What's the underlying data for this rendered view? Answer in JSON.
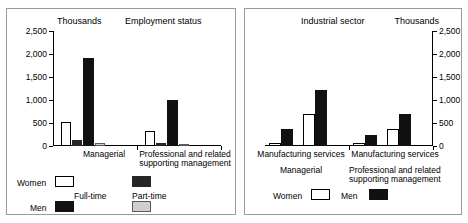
{
  "chart_data": [
    {
      "type": "bar",
      "title": "Employment status",
      "unit_label": "Thousands",
      "xlabel": "",
      "ylabel": "Thousands",
      "ylim": [
        0,
        2500
      ],
      "ytick_labels": [
        "2,500",
        "2,000",
        "1,500",
        "1,000",
        "500",
        "0"
      ],
      "ytick_values": [
        2500,
        2000,
        1500,
        1000,
        500,
        0
      ],
      "grid": false,
      "categories": [
        "Managerial",
        "Professional and related supporting management"
      ],
      "series": [
        {
          "name": "Women Full-time",
          "style": "white",
          "values": [
            520,
            330
          ]
        },
        {
          "name": "Women Part-time",
          "style": "dark",
          "values": [
            120,
            65
          ]
        },
        {
          "name": "Men Full-time",
          "style": "black",
          "values": [
            1910,
            1010
          ]
        },
        {
          "name": "Men Part-time",
          "style": "gray",
          "values": [
            70,
            45
          ]
        }
      ],
      "legend": {
        "position": "below-plot",
        "row_labels": [
          "Women",
          "Men"
        ],
        "column_labels": [
          "Full-time",
          "Part-time"
        ],
        "entries": [
          {
            "row": "Women",
            "column": "Full-time",
            "style": "white"
          },
          {
            "row": "Women",
            "column": "Part-time",
            "style": "dark"
          },
          {
            "row": "Men",
            "column": "Full-time",
            "style": "black"
          },
          {
            "row": "Men",
            "column": "Part-time",
            "style": "gray"
          }
        ]
      }
    },
    {
      "type": "bar",
      "title": "Industrial sector",
      "unit_label": "Thousands",
      "xlabel": "",
      "ylabel": "Thousands",
      "ylim": [
        0,
        2500
      ],
      "ytick_labels": [
        "2,500",
        "2,000",
        "1,500",
        "1,000",
        "500",
        "0"
      ],
      "ytick_values": [
        2500,
        2000,
        1500,
        1000,
        500,
        0
      ],
      "grid": false,
      "categories": [
        "Managerial",
        "Professional and related supporting management"
      ],
      "sectors": [
        "Manufacturing",
        "services"
      ],
      "x_tick_labels": [
        "Manufacturing services",
        "Manufacturing services"
      ],
      "series": [
        {
          "name": "Women",
          "style": "white",
          "values": [
            60,
            700,
            70,
            380
          ]
        },
        {
          "name": "Men",
          "style": "black",
          "values": [
            370,
            1210,
            230,
            700
          ]
        }
      ],
      "legend": {
        "position": "below-plot",
        "entries": [
          {
            "label": "Women",
            "style": "white"
          },
          {
            "label": "Men",
            "style": "black"
          }
        ]
      }
    }
  ],
  "left_panel": {
    "unit_label": "Thousands",
    "title": "Employment status",
    "y_ticks": [
      "2,500",
      "2,000",
      "1,500",
      "1,000",
      "500",
      "0"
    ],
    "group_labels": {
      "managerial": "Managerial",
      "professional_line1": "Professional and related",
      "professional_line2": "supporting management"
    },
    "legend": {
      "women": "Women",
      "men": "Men",
      "full_time": "Full-time",
      "part_time": "Part-time"
    },
    "bars": [
      {
        "group": "Managerial",
        "series": "Women Full-time",
        "value": 520,
        "style": "white"
      },
      {
        "group": "Managerial",
        "series": "Women Part-time",
        "value": 120,
        "style": "dark"
      },
      {
        "group": "Managerial",
        "series": "Men Full-time",
        "value": 1910,
        "style": "black"
      },
      {
        "group": "Managerial",
        "series": "Men Part-time",
        "value": 70,
        "style": "gray"
      },
      {
        "group": "Professional",
        "series": "Women Full-time",
        "value": 330,
        "style": "white"
      },
      {
        "group": "Professional",
        "series": "Women Part-time",
        "value": 65,
        "style": "dark"
      },
      {
        "group": "Professional",
        "series": "Men Full-time",
        "value": 1010,
        "style": "black"
      },
      {
        "group": "Professional",
        "series": "Men Part-time",
        "value": 45,
        "style": "gray"
      }
    ]
  },
  "right_panel": {
    "unit_label": "Thousands",
    "title": "Industrial sector",
    "y_ticks": [
      "2,500",
      "2,000",
      "1,500",
      "1,000",
      "500",
      "0"
    ],
    "x_labels": {
      "group1": "Manufacturing services",
      "group2": "Manufacturing services"
    },
    "group_labels": {
      "managerial": "Managerial",
      "professional_line1": "Professional and related",
      "professional_line2": "supporting management"
    },
    "legend": {
      "women": "Women",
      "men": "Men"
    },
    "bars": [
      {
        "group": "Managerial",
        "sector": "Manufacturing",
        "series": "Women",
        "value": 60,
        "style": "white"
      },
      {
        "group": "Managerial",
        "sector": "Manufacturing",
        "series": "Men",
        "value": 370,
        "style": "black"
      },
      {
        "group": "Managerial",
        "sector": "services",
        "series": "Women",
        "value": 700,
        "style": "white"
      },
      {
        "group": "Managerial",
        "sector": "services",
        "series": "Men",
        "value": 1210,
        "style": "black"
      },
      {
        "group": "Professional",
        "sector": "Manufacturing",
        "series": "Women",
        "value": 70,
        "style": "white"
      },
      {
        "group": "Professional",
        "sector": "Manufacturing",
        "series": "Men",
        "value": 230,
        "style": "black"
      },
      {
        "group": "Professional",
        "sector": "services",
        "series": "Women",
        "value": 380,
        "style": "white"
      },
      {
        "group": "Professional",
        "sector": "services",
        "series": "Men",
        "value": 700,
        "style": "black"
      }
    ]
  }
}
